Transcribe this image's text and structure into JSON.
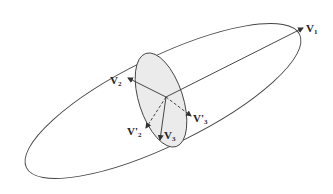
{
  "diagram": {
    "title": "",
    "colors": {
      "stroke": "#333333",
      "disk_fill": "#ebebeb",
      "background": "#ffffff"
    },
    "shapes": {
      "outer_ellipse": {
        "cx": 163,
        "cy": 101,
        "rx": 152,
        "ry": 44,
        "rotate": -26
      },
      "inner_disk": {
        "cx": 161,
        "cy": 100,
        "rx": 22,
        "ry": 49,
        "rotate": -18
      },
      "origin": {
        "x": 166,
        "y": 97
      }
    },
    "vectors": [
      {
        "id": "v1",
        "label": "V",
        "sub": "1",
        "style": "solid",
        "x2": 303,
        "y2": 28,
        "lx": 306,
        "ly": 23
      },
      {
        "id": "v2",
        "label": "V",
        "sub": "2",
        "style": "solid",
        "x2": 128,
        "y2": 78,
        "lx": 110,
        "ly": 75
      },
      {
        "id": "v3",
        "label": "V",
        "sub": "3",
        "style": "solid",
        "x2": 160,
        "y2": 140,
        "lx": 164,
        "ly": 130
      },
      {
        "id": "v2p",
        "label": "V'",
        "sub": "2",
        "style": "dashed",
        "x2": 146,
        "y2": 128,
        "lx": 127,
        "ly": 126
      },
      {
        "id": "v3p",
        "label": "V'",
        "sub": "3",
        "style": "dashed",
        "x2": 191,
        "y2": 116,
        "lx": 193,
        "ly": 113
      }
    ]
  }
}
